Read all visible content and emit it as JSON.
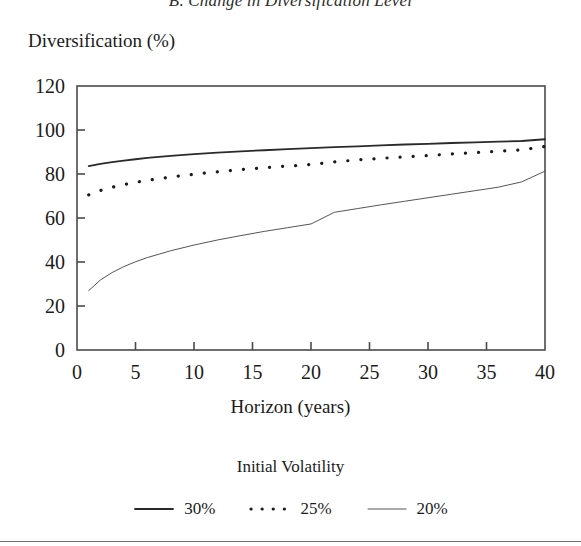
{
  "figure": {
    "panel_title": "B. Change in Diversification Level",
    "x_axis_title": "Horizon (years)",
    "y_axis_title": "Diversification (%)",
    "legend_title": "Initial Volatility"
  },
  "colors": {
    "ink": "#1b1b1b",
    "axis": "#4a4a4a",
    "series_30": "#2a2a2a",
    "series_25": "#1a1a1a",
    "series_20": "#555555",
    "background": "#ffffff"
  },
  "chart_data": {
    "type": "line",
    "title": "B. Change in Diversification Level",
    "xlabel": "Horizon (years)",
    "ylabel": "Diversification (%)",
    "xlim": [
      0,
      40
    ],
    "ylim": [
      0,
      120
    ],
    "xticks": [
      0,
      5,
      10,
      15,
      20,
      25,
      30,
      35,
      40
    ],
    "yticks": [
      0,
      20,
      40,
      60,
      80,
      100,
      120
    ],
    "grid": false,
    "legend_position": "below",
    "legend_title": "Initial Volatility",
    "x": [
      1,
      2,
      3,
      4,
      5,
      6,
      8,
      10,
      12,
      14,
      16,
      18,
      20,
      22,
      24,
      26,
      28,
      30,
      32,
      34,
      36,
      38,
      40
    ],
    "series": [
      {
        "name": "30%",
        "style": "solid",
        "width": 1.8,
        "values": [
          83.6,
          84.6,
          85.4,
          86.1,
          86.7,
          87.3,
          88.2,
          89.0,
          89.7,
          90.3,
          90.8,
          91.3,
          91.8,
          92.2,
          92.6,
          93.0,
          93.4,
          93.7,
          94.1,
          94.4,
          94.7,
          95.0,
          95.8
        ]
      },
      {
        "name": "25%",
        "style": "dotted",
        "width": 3.2,
        "values": [
          70.5,
          72.5,
          74.0,
          75.2,
          76.2,
          77.1,
          78.6,
          79.9,
          81.0,
          82.0,
          82.8,
          83.6,
          84.3,
          85.5,
          86.4,
          87.1,
          87.8,
          88.4,
          89.1,
          89.7,
          90.3,
          91.0,
          92.5
        ]
      },
      {
        "name": "20%",
        "style": "solid",
        "width": 1.0,
        "values": [
          27.0,
          31.8,
          35.2,
          37.9,
          40.1,
          42.0,
          45.1,
          47.7,
          50.0,
          52.0,
          53.9,
          55.6,
          57.3,
          62.6,
          64.3,
          66.0,
          67.6,
          69.2,
          70.8,
          72.4,
          74.0,
          76.4,
          81.3
        ]
      }
    ]
  },
  "legend_items": [
    {
      "label": "30%",
      "style": "solid-thick"
    },
    {
      "label": "25%",
      "style": "dotted"
    },
    {
      "label": "20%",
      "style": "solid-thin"
    }
  ],
  "tick_labels": {
    "y": [
      "120",
      "100",
      "80",
      "60",
      "40",
      "20",
      "0"
    ],
    "x": [
      "0",
      "5",
      "10",
      "15",
      "20",
      "25",
      "30",
      "35",
      "40"
    ]
  }
}
